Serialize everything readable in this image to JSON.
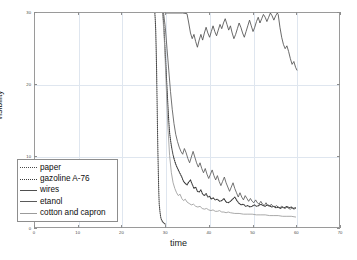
{
  "chart_data": {
    "type": "line",
    "title": "",
    "xlabel": "time",
    "ylabel": "visibility",
    "xlim": [
      0,
      70
    ],
    "ylim": [
      0,
      30
    ],
    "xticks": [
      0,
      10,
      20,
      30,
      40,
      50,
      60,
      70
    ],
    "xtick_labels": [
      "0",
      "10",
      "20",
      "30",
      "40",
      "50",
      "60",
      "70"
    ],
    "yticks": [
      0,
      10,
      20,
      30
    ],
    "ytick_labels": [
      "0",
      "10",
      "20",
      "30"
    ],
    "grid": true,
    "legend_position": "lower left",
    "series": [
      {
        "name": "paper",
        "style": "dotted",
        "color": "#4a4a4a",
        "points": [
          [
            27.6,
            30.0
          ],
          [
            27.7,
            29.0
          ],
          [
            27.8,
            27.5
          ],
          [
            27.9,
            25.0
          ],
          [
            28.0,
            22.0
          ],
          [
            28.1,
            18.0
          ],
          [
            28.2,
            14.0
          ],
          [
            28.3,
            10.5
          ],
          [
            28.4,
            7.5
          ],
          [
            28.5,
            5.0
          ],
          [
            28.6,
            3.2
          ],
          [
            28.8,
            2.0
          ],
          [
            29.0,
            1.2
          ],
          [
            29.4,
            0.7
          ],
          [
            30.0,
            0.4
          ]
        ]
      },
      {
        "name": "gazoline A-76",
        "style": "dotted",
        "color": "#3a3a3a",
        "points": [
          [
            29.4,
            30.0
          ],
          [
            29.5,
            29.6
          ],
          [
            29.6,
            28.8
          ],
          [
            29.7,
            27.8
          ],
          [
            29.8,
            26.6
          ],
          [
            29.9,
            25.4
          ],
          [
            30.0,
            24.2
          ],
          [
            30.1,
            23.0
          ],
          [
            30.2,
            21.8
          ],
          [
            30.3,
            20.6
          ],
          [
            30.4,
            19.4
          ],
          [
            30.5,
            18.2
          ],
          [
            30.6,
            17.0
          ],
          [
            30.7,
            15.9
          ],
          [
            30.8,
            14.9
          ],
          [
            30.9,
            14.0
          ],
          [
            31.0,
            13.2
          ],
          [
            31.2,
            12.2
          ],
          [
            31.4,
            11.4
          ],
          [
            31.6,
            10.7
          ],
          [
            31.8,
            10.1
          ],
          [
            32.0,
            9.6
          ],
          [
            32.3,
            9.0
          ],
          [
            32.6,
            8.5
          ],
          [
            33.0,
            8.0
          ],
          [
            33.4,
            7.5
          ],
          [
            33.8,
            7.0
          ],
          [
            34.2,
            6.4
          ],
          [
            34.6,
            6.1
          ],
          [
            35.0,
            5.9
          ],
          [
            35.4,
            6.3
          ],
          [
            35.8,
            6.6
          ],
          [
            36.2,
            6.0
          ],
          [
            36.6,
            5.4
          ],
          [
            37.0,
            5.6
          ],
          [
            37.4,
            5.0
          ],
          [
            37.8,
            4.9
          ],
          [
            38.2,
            5.2
          ],
          [
            38.6,
            4.6
          ],
          [
            39.0,
            4.4
          ],
          [
            39.4,
            4.7
          ],
          [
            39.8,
            4.2
          ],
          [
            40.2,
            4.3
          ],
          [
            40.6,
            3.9
          ],
          [
            41.0,
            4.1
          ],
          [
            41.5,
            3.8
          ],
          [
            42.0,
            3.9
          ],
          [
            42.5,
            3.6
          ],
          [
            43.0,
            3.7
          ],
          [
            43.5,
            4.0
          ],
          [
            44.0,
            3.5
          ],
          [
            44.5,
            3.4
          ],
          [
            45.0,
            3.6
          ],
          [
            45.5,
            3.9
          ],
          [
            46.0,
            4.2
          ],
          [
            46.5,
            3.7
          ],
          [
            47.0,
            3.3
          ],
          [
            47.5,
            3.1
          ],
          [
            48.0,
            3.2
          ],
          [
            48.5,
            2.9
          ],
          [
            49.0,
            3.0
          ],
          [
            49.5,
            2.8
          ],
          [
            50.0,
            2.9
          ],
          [
            50.5,
            3.1
          ],
          [
            51.0,
            2.9
          ],
          [
            51.5,
            3.0
          ],
          [
            52.0,
            3.2
          ],
          [
            52.5,
            3.0
          ],
          [
            53.0,
            2.9
          ],
          [
            53.5,
            3.1
          ],
          [
            54.0,
            3.0
          ],
          [
            54.5,
            2.8
          ],
          [
            55.0,
            2.9
          ],
          [
            55.5,
            2.7
          ],
          [
            56.0,
            2.8
          ],
          [
            56.5,
            2.6
          ],
          [
            57.0,
            2.8
          ],
          [
            57.5,
            2.7
          ],
          [
            58.0,
            2.9
          ],
          [
            58.5,
            2.7
          ],
          [
            59.0,
            2.8
          ],
          [
            59.5,
            2.6
          ],
          [
            60.0,
            2.7
          ]
        ]
      },
      {
        "name": "wires",
        "style": "solid",
        "color": "#4f4f4f",
        "points": [
          [
            30.0,
            30.0
          ],
          [
            32.0,
            30.0
          ],
          [
            34.0,
            30.0
          ],
          [
            35.0,
            29.9
          ],
          [
            35.4,
            28.6
          ],
          [
            35.8,
            27.2
          ],
          [
            36.2,
            26.4
          ],
          [
            36.6,
            27.0
          ],
          [
            37.0,
            26.0
          ],
          [
            37.4,
            25.2
          ],
          [
            37.8,
            26.2
          ],
          [
            38.2,
            27.0
          ],
          [
            38.6,
            26.2
          ],
          [
            39.0,
            27.2
          ],
          [
            39.4,
            28.0
          ],
          [
            39.8,
            27.2
          ],
          [
            40.2,
            26.6
          ],
          [
            40.6,
            27.4
          ],
          [
            41.0,
            28.2
          ],
          [
            41.4,
            27.4
          ],
          [
            41.8,
            26.8
          ],
          [
            42.2,
            27.6
          ],
          [
            42.6,
            28.4
          ],
          [
            43.0,
            27.8
          ],
          [
            43.4,
            28.6
          ],
          [
            43.8,
            29.2
          ],
          [
            44.2,
            28.4
          ],
          [
            44.6,
            27.6
          ],
          [
            45.0,
            28.2
          ],
          [
            45.4,
            27.2
          ],
          [
            45.8,
            26.4
          ],
          [
            46.2,
            27.0
          ],
          [
            46.6,
            27.8
          ],
          [
            47.0,
            28.6
          ],
          [
            47.4,
            28.0
          ],
          [
            47.8,
            27.2
          ],
          [
            48.2,
            26.6
          ],
          [
            48.6,
            27.4
          ],
          [
            49.0,
            28.2
          ],
          [
            49.4,
            29.0
          ],
          [
            49.8,
            28.2
          ],
          [
            50.2,
            27.4
          ],
          [
            50.6,
            28.0
          ],
          [
            51.0,
            28.8
          ],
          [
            51.4,
            29.4
          ],
          [
            51.8,
            28.6
          ],
          [
            52.2,
            29.2
          ],
          [
            52.6,
            29.8
          ],
          [
            53.0,
            29.4
          ],
          [
            53.4,
            28.8
          ],
          [
            53.8,
            29.4
          ],
          [
            54.2,
            30.0
          ],
          [
            54.6,
            29.6
          ],
          [
            55.0,
            29.0
          ],
          [
            55.4,
            29.6
          ],
          [
            55.8,
            30.0
          ],
          [
            56.0,
            29.8
          ],
          [
            56.4,
            28.0
          ],
          [
            56.8,
            26.6
          ],
          [
            57.2,
            25.6
          ],
          [
            57.6,
            25.0
          ],
          [
            58.0,
            25.4
          ],
          [
            58.4,
            24.6
          ],
          [
            58.8,
            23.6
          ],
          [
            59.2,
            22.8
          ],
          [
            59.6,
            23.2
          ],
          [
            60.0,
            22.4
          ],
          [
            60.3,
            22.0
          ]
        ]
      },
      {
        "name": "etanol",
        "style": "solid",
        "color": "#5a5a5a",
        "points": [
          [
            29.6,
            30.0
          ],
          [
            30.0,
            28.0
          ],
          [
            30.4,
            25.0
          ],
          [
            30.8,
            22.0
          ],
          [
            31.2,
            19.0
          ],
          [
            31.6,
            16.5
          ],
          [
            32.0,
            14.5
          ],
          [
            32.4,
            13.0
          ],
          [
            32.8,
            12.0
          ],
          [
            33.2,
            11.2
          ],
          [
            33.6,
            10.6
          ],
          [
            34.0,
            10.2
          ],
          [
            34.4,
            11.0
          ],
          [
            34.8,
            10.4
          ],
          [
            35.2,
            9.6
          ],
          [
            35.6,
            9.0
          ],
          [
            36.0,
            9.8
          ],
          [
            36.4,
            10.6
          ],
          [
            36.8,
            9.8
          ],
          [
            37.2,
            9.0
          ],
          [
            37.6,
            8.4
          ],
          [
            38.0,
            9.0
          ],
          [
            38.4,
            8.2
          ],
          [
            38.8,
            7.6
          ],
          [
            39.2,
            8.2
          ],
          [
            39.6,
            7.4
          ],
          [
            40.0,
            6.8
          ],
          [
            40.4,
            7.4
          ],
          [
            40.8,
            8.0
          ],
          [
            41.2,
            7.2
          ],
          [
            41.6,
            6.6
          ],
          [
            42.0,
            7.2
          ],
          [
            42.4,
            6.4
          ],
          [
            42.8,
            5.8
          ],
          [
            43.2,
            6.4
          ],
          [
            43.6,
            7.0
          ],
          [
            44.0,
            6.2
          ],
          [
            44.4,
            5.6
          ],
          [
            44.8,
            5.0
          ],
          [
            45.2,
            5.6
          ],
          [
            45.6,
            6.2
          ],
          [
            46.0,
            5.4
          ],
          [
            46.4,
            4.8
          ],
          [
            46.8,
            4.2
          ],
          [
            47.2,
            4.8
          ],
          [
            47.6,
            4.2
          ],
          [
            48.0,
            3.8
          ],
          [
            48.4,
            4.4
          ],
          [
            48.8,
            4.0
          ],
          [
            49.2,
            3.6
          ],
          [
            49.6,
            4.0
          ],
          [
            50.0,
            3.6
          ],
          [
            50.4,
            3.4
          ],
          [
            50.8,
            3.8
          ],
          [
            51.2,
            3.4
          ],
          [
            51.6,
            3.2
          ],
          [
            52.0,
            3.6
          ],
          [
            52.4,
            3.2
          ],
          [
            52.8,
            3.0
          ],
          [
            53.2,
            3.4
          ],
          [
            53.6,
            3.0
          ],
          [
            54.0,
            2.9
          ],
          [
            54.4,
            3.2
          ],
          [
            54.8,
            2.9
          ],
          [
            55.2,
            2.8
          ],
          [
            55.6,
            3.0
          ],
          [
            56.0,
            2.8
          ],
          [
            56.4,
            2.7
          ],
          [
            56.8,
            2.9
          ],
          [
            57.2,
            2.7
          ],
          [
            57.6,
            2.6
          ],
          [
            58.0,
            2.8
          ],
          [
            58.4,
            2.6
          ],
          [
            58.8,
            2.5
          ],
          [
            59.2,
            2.7
          ],
          [
            59.6,
            2.5
          ],
          [
            60.0,
            2.6
          ]
        ]
      },
      {
        "name": "cotton and capron",
        "style": "solid",
        "color": "#9b9b9b",
        "points": [
          [
            29.4,
            30.0
          ],
          [
            29.8,
            26.0
          ],
          [
            30.2,
            20.0
          ],
          [
            30.6,
            14.0
          ],
          [
            31.0,
            10.0
          ],
          [
            31.4,
            7.6
          ],
          [
            31.8,
            6.2
          ],
          [
            32.2,
            5.4
          ],
          [
            32.6,
            4.8
          ],
          [
            33.0,
            4.4
          ],
          [
            33.4,
            4.6
          ],
          [
            33.8,
            4.0
          ],
          [
            34.2,
            3.7
          ],
          [
            34.6,
            3.9
          ],
          [
            35.0,
            3.5
          ],
          [
            35.5,
            3.3
          ],
          [
            36.0,
            3.1
          ],
          [
            36.5,
            3.2
          ],
          [
            37.0,
            2.9
          ],
          [
            37.5,
            2.8
          ],
          [
            38.0,
            2.9
          ],
          [
            38.5,
            2.6
          ],
          [
            39.0,
            2.5
          ],
          [
            39.5,
            2.6
          ],
          [
            40.0,
            2.4
          ],
          [
            40.5,
            2.3
          ],
          [
            41.0,
            2.4
          ],
          [
            41.5,
            2.2
          ],
          [
            42.0,
            2.2
          ],
          [
            42.5,
            2.3
          ],
          [
            43.0,
            2.1
          ],
          [
            43.5,
            2.1
          ],
          [
            44.0,
            2.0
          ],
          [
            44.5,
            2.1
          ],
          [
            45.0,
            2.0
          ],
          [
            46.0,
            1.9
          ],
          [
            47.0,
            1.9
          ],
          [
            48.0,
            1.8
          ],
          [
            49.0,
            1.8
          ],
          [
            50.0,
            1.8
          ],
          [
            51.0,
            1.7
          ],
          [
            52.0,
            1.7
          ],
          [
            53.0,
            1.7
          ],
          [
            54.0,
            1.6
          ],
          [
            55.0,
            1.6
          ],
          [
            56.0,
            1.6
          ],
          [
            57.0,
            1.5
          ],
          [
            58.0,
            1.5
          ],
          [
            59.0,
            1.5
          ],
          [
            60.0,
            1.4
          ]
        ]
      }
    ]
  }
}
